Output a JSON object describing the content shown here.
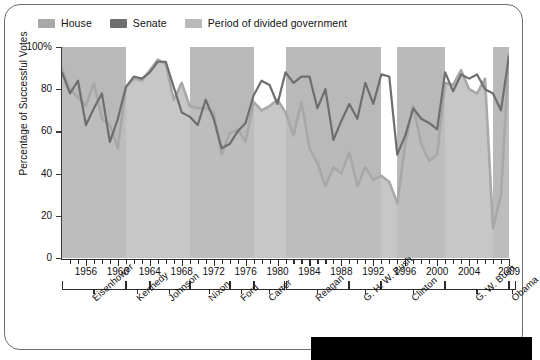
{
  "legend": {
    "items": [
      {
        "label": "House",
        "color": "#a8a8a8",
        "name": "legend-house"
      },
      {
        "label": "Senate",
        "color": "#6e6e6e",
        "name": "legend-senate"
      },
      {
        "label": "Period of divided government",
        "color": "#b9b9b9",
        "name": "legend-divided"
      }
    ]
  },
  "chart_data": {
    "type": "line",
    "title": "",
    "xlabel": "",
    "ylabel": "Percentage of Successful Votes",
    "ylim": [
      0,
      100
    ],
    "yticks": [
      0,
      20,
      40,
      60,
      80,
      100
    ],
    "ytick_labels": [
      "0",
      "20",
      "40",
      "60",
      "80",
      "100%"
    ],
    "xlim": [
      1953,
      2009
    ],
    "xticks": [
      1956,
      1960,
      1964,
      1968,
      1972,
      1976,
      1980,
      1984,
      1988,
      1992,
      1996,
      2000,
      2004,
      2009
    ],
    "xtick_labels": [
      "1956",
      "1960",
      "1964",
      "1968",
      "1972",
      "1976",
      "1980",
      "1984",
      "1988",
      "1992",
      "1996",
      "2000",
      "2004",
      "2009"
    ],
    "grid": false,
    "legend_position": "top-left",
    "x": [
      1953,
      1954,
      1955,
      1956,
      1957,
      1958,
      1959,
      1960,
      1961,
      1962,
      1963,
      1964,
      1965,
      1966,
      1967,
      1968,
      1969,
      1970,
      1971,
      1972,
      1973,
      1974,
      1975,
      1976,
      1977,
      1978,
      1979,
      1980,
      1981,
      1982,
      1983,
      1984,
      1985,
      1986,
      1987,
      1988,
      1989,
      1990,
      1991,
      1992,
      1993,
      1994,
      1995,
      1996,
      1997,
      1998,
      1999,
      2000,
      2001,
      2002,
      2003,
      2004,
      2005,
      2006,
      2007,
      2008,
      2009
    ],
    "series": [
      {
        "name": "House",
        "color": "#a8a8a8",
        "values": [
          90,
          80,
          76,
          72,
          83,
          66,
          63,
          52,
          81,
          85,
          84,
          89,
          94,
          92,
          75,
          83,
          72,
          71,
          71,
          69,
          49,
          59,
          61,
          55,
          74,
          70,
          72,
          75,
          69,
          58,
          74,
          52,
          45,
          34,
          43,
          40,
          50,
          34,
          43,
          37,
          39,
          36,
          26,
          54,
          72,
          54,
          46,
          49,
          83,
          82,
          89,
          80,
          78,
          85,
          14,
          30,
          97
        ]
      },
      {
        "name": "Senate",
        "color": "#6e6e6e",
        "values": [
          88,
          78,
          84,
          63,
          71,
          78,
          55,
          66,
          81,
          86,
          85,
          88,
          93,
          93,
          81,
          69,
          67,
          63,
          75,
          66,
          52,
          54,
          60,
          64,
          77,
          84,
          82,
          73,
          88,
          83,
          86,
          86,
          71,
          80,
          56,
          65,
          73,
          66,
          83,
          73,
          87,
          86,
          49,
          58,
          71,
          66,
          64,
          61,
          88,
          79,
          87,
          85,
          87,
          80,
          78,
          70,
          96
        ]
      }
    ],
    "divided_periods": [
      {
        "start": 1953,
        "end": 1961,
        "label": "Eisenhower divided"
      },
      {
        "start": 1969,
        "end": 1977,
        "label": "Nixon-Ford divided"
      },
      {
        "start": 1981,
        "end": 1993,
        "label": "Reagan-G.H.W. Bush divided"
      },
      {
        "start": 1995,
        "end": 2001,
        "label": "Clinton divided"
      },
      {
        "start": 2007,
        "end": 2009,
        "label": "G.W. Bush divided"
      }
    ],
    "presidents": [
      {
        "name": "Eisenhower",
        "start": 1953,
        "end": 1961
      },
      {
        "name": "Kennedy",
        "start": 1961,
        "end": 1964
      },
      {
        "name": "Johnson",
        "start": 1964,
        "end": 1969
      },
      {
        "name": "Nixon",
        "start": 1969,
        "end": 1974
      },
      {
        "name": "Ford",
        "start": 1974,
        "end": 1977
      },
      {
        "name": "Carter",
        "start": 1977,
        "end": 1981
      },
      {
        "name": "Reagan",
        "start": 1981,
        "end": 1989
      },
      {
        "name": "G. H. W. Bush",
        "start": 1989,
        "end": 1993
      },
      {
        "name": "Clinton",
        "start": 1993,
        "end": 2001
      },
      {
        "name": "G. W. Bush",
        "start": 2001,
        "end": 2009
      },
      {
        "name": "Obama",
        "start": 2009,
        "end": 2009.9
      }
    ]
  }
}
